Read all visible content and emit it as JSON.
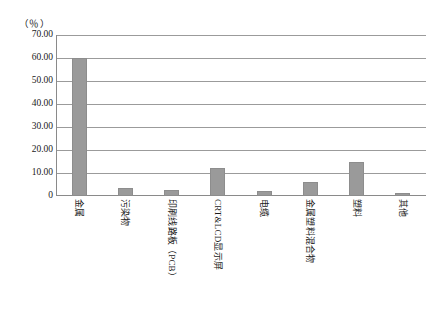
{
  "chart_data": {
    "type": "bar",
    "title": "",
    "subtitle": "",
    "unit_label": "（％）",
    "xlabel": "",
    "ylabel": "",
    "ylim": [
      0,
      70
    ],
    "grid": true,
    "legend": "none",
    "ytick_labels": [
      "70.00",
      "60.00",
      "50.00",
      "40.00",
      "30.00",
      "20.00",
      "10.00",
      "0"
    ],
    "ytick_values": [
      70,
      60,
      50,
      40,
      30,
      20,
      10,
      0
    ],
    "categories": [
      "金属",
      "污染物",
      "印刷线路板（PCB）",
      "CRT&LCD显示屏",
      "电缆",
      "金属塑料混合物",
      "塑料",
      "其他"
    ],
    "values": [
      60.0,
      3.7,
      2.5,
      12.0,
      2.0,
      6.0,
      15.0,
      1.5
    ],
    "series": [
      {
        "name": "占比",
        "values": [
          60.0,
          3.7,
          2.5,
          12.0,
          2.0,
          6.0,
          15.0,
          1.5
        ]
      }
    ],
    "bar_color": "#9a9a9a",
    "bar_border_color": "#8d8d8d",
    "grid_color": "#9b9b9b",
    "axis_color": "#8a8a8a"
  }
}
